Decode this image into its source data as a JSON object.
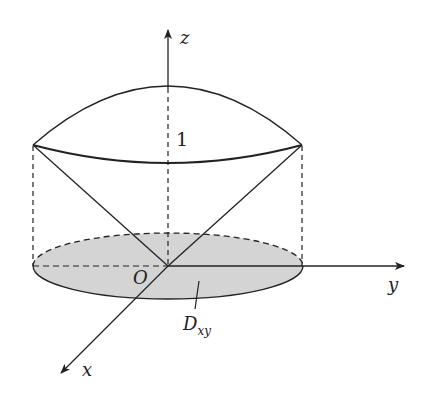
{
  "figure": {
    "type": "3d-solid-diagram",
    "colors": {
      "stroke": "#222222",
      "region_fill": "#d4d4d4",
      "background": "#ffffff"
    }
  },
  "axes": {
    "z": {
      "label": "z"
    },
    "y": {
      "label": "y"
    },
    "x": {
      "label": "x"
    },
    "origin": {
      "label": "O"
    }
  },
  "annotations": {
    "height_label": "1",
    "region_label_main": "D",
    "region_label_sub": "xy"
  }
}
